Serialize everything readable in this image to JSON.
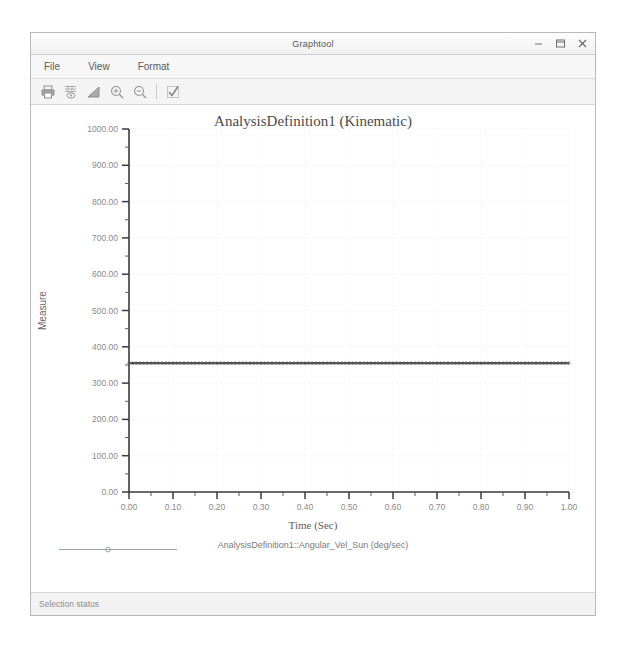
{
  "window": {
    "title": "Graphtool",
    "controls": [
      {
        "name": "minimize-button",
        "glyph": "minimize"
      },
      {
        "name": "maximize-button",
        "glyph": "maximize"
      },
      {
        "name": "close-button",
        "glyph": "close"
      }
    ]
  },
  "menubar": {
    "items": [
      {
        "label": "File"
      },
      {
        "label": "View"
      },
      {
        "label": "Format"
      }
    ]
  },
  "toolbar": {
    "buttons": [
      {
        "name": "print-icon",
        "tip": "Print"
      },
      {
        "name": "table-data-icon",
        "tip": "Data Table"
      },
      {
        "name": "chart-icon",
        "tip": "Chart"
      },
      {
        "name": "zoom-in-icon",
        "tip": "Zoom In"
      },
      {
        "name": "zoom-out-icon",
        "tip": "Zoom Out"
      },
      {
        "name": "checkmark-icon",
        "tip": "Apply"
      }
    ]
  },
  "statusbar": {
    "text": "Selection status"
  },
  "chart_data": {
    "type": "line",
    "title": "AnalysisDefinition1 (Kinematic)",
    "xlabel": "Time (Sec)",
    "ylabel": "Measure",
    "xlim": [
      0,
      1
    ],
    "ylim": [
      0,
      1000
    ],
    "grid": true,
    "legend_position": "bottom",
    "xticks": [
      0,
      0.1,
      0.2,
      0.3,
      0.4,
      0.5,
      0.6,
      0.7,
      0.8,
      0.9,
      1
    ],
    "xticklabels": [
      "0.00",
      "0.10",
      "0.20",
      "0.30",
      "0.40",
      "0.50",
      "0.60",
      "0.70",
      "0.80",
      "0.90",
      "1.00"
    ],
    "yticks": [
      0,
      100,
      200,
      300,
      400,
      500,
      600,
      700,
      800,
      900,
      1000
    ],
    "yticklabels": [
      "0.00",
      "100.00",
      "200.00",
      "300.00",
      "400.00",
      "500.00",
      "600.00",
      "700.00",
      "800.00",
      "900.00",
      "1000.00"
    ],
    "minor_tick_step_y": 50,
    "minor_tick_step_x": 0.05,
    "series": [
      {
        "name": "AnalysisDefinition1::Angular_Vel_Sun (deg/sec)",
        "color": "#555555",
        "x": [
          0,
          0.05,
          0.1,
          0.15,
          0.2,
          0.25,
          0.3,
          0.35,
          0.4,
          0.45,
          0.5,
          0.55,
          0.6,
          0.65,
          0.7,
          0.75,
          0.8,
          0.85,
          0.9,
          0.95,
          1
        ],
        "values": [
          355,
          355,
          355,
          355,
          355,
          355,
          355,
          355,
          355,
          355,
          355,
          355,
          355,
          355,
          355,
          355,
          355,
          355,
          355,
          355,
          355
        ]
      }
    ]
  }
}
